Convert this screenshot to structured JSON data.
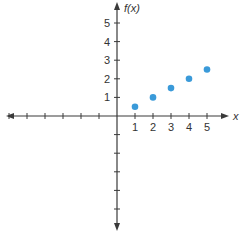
{
  "chart_data": {
    "type": "scatter",
    "title": "",
    "xlabel": "x",
    "ylabel": "f(x)",
    "xlim": [
      -6,
      6
    ],
    "ylim": [
      -6,
      6
    ],
    "x_tick_labels": [
      "1",
      "2",
      "3",
      "4",
      "5"
    ],
    "y_tick_labels": [
      "1",
      "2",
      "3",
      "4",
      "5"
    ],
    "grid": false,
    "legend": null,
    "series": [
      {
        "name": "f(x)",
        "color": "#3a9ad9",
        "x": [
          1,
          2,
          3,
          4,
          5
        ],
        "y": [
          0.5,
          1,
          1.5,
          2,
          2.5
        ]
      }
    ]
  },
  "labels": {
    "x_axis": "x",
    "y_axis": "f(x)"
  }
}
